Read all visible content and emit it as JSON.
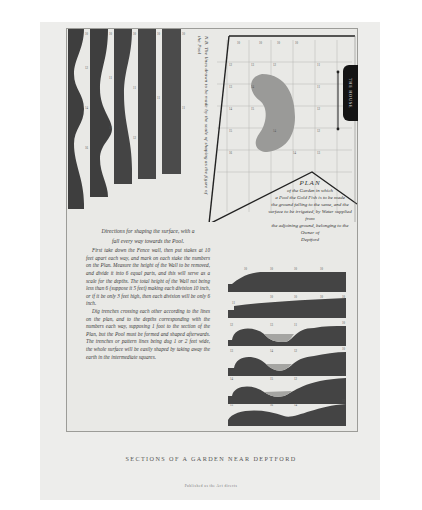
{
  "document": {
    "kind": "engraved plate",
    "bottom_title": "SECTIONS OF A GARDEN NEAR DEPTFORD",
    "imprint": "Published as the Act directs"
  },
  "strips": {
    "count": 5,
    "note": "N.B. The lines drawn to be made by the scale of shaping as the figure of the Pool"
  },
  "plan": {
    "house_label": "THE HOUSE",
    "side_label": "Ground between Wall & Fence",
    "grid_side_label": "Part of Garden laid to the same level",
    "caption_title": "PLAN",
    "caption_lines": [
      "of the Garden in which",
      "a Pool the Gold Fish is to be made",
      "the ground falling to the same, and the",
      "surface to be irrigated, by Water supplied from",
      "the adjoining ground, belonging to the Owner of",
      "Deptford"
    ]
  },
  "directions": {
    "heading_line1": "Directions for shaping the surface, with a",
    "heading_line2": "fall every way towards the Pool.",
    "paragraphs": [
      "First take down the Fence wall, then put stakes at 10 feet apart each way, and mark on each stake the numbers on the Plan. Measure the height of the Wall to be removed, and divide it into 6 equal parts, and this will serve as a scale for the depths. The total height of the Wall not being less than 6 (suppose it 5 feet) making each division 10 inch, or if it be only 3 feet high, then each division will be only 6 inch.",
      "Dig trenches crossing each other according to the lines on the plan, and to the depths corresponding with the numbers each way, supposing 1 foot to the section of the Plan, but the Pool must be formed and shaped afterwards. The trenches or pattern lines being dug 1 or 2 feet wide, the whole surface will be easily shaped by taking away the earth in the intermediate squares."
    ]
  },
  "sections": {
    "count": 6,
    "labels": [
      "A",
      "B",
      "C",
      "D",
      "E",
      "F"
    ]
  },
  "colors": {
    "paper": "#ededeb",
    "ink": "#3a3a3a",
    "fill_dark": "#4a4a4a",
    "pool_gray": "#9a9a98"
  }
}
